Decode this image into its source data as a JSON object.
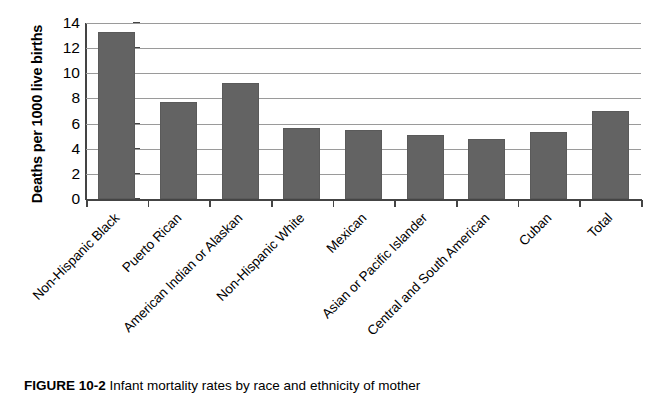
{
  "chart_data": {
    "type": "bar",
    "title": "",
    "xlabel": "",
    "ylabel": "Deaths per 1000 live births",
    "ylim": [
      0,
      14
    ],
    "ytick_labels": [
      "14",
      "12",
      "10",
      "8",
      "6",
      "4",
      "2",
      "0"
    ],
    "yticks": [
      14,
      12,
      10,
      8,
      6,
      4,
      2,
      0
    ],
    "grid": "horizontal",
    "legend": "none",
    "bar_color": "#636363",
    "categories": [
      "Non-Hispanic Black",
      "Puerto Rican",
      "American Indian or Alaskan",
      "Non-Hispanic White",
      "Mexican",
      "Asian or Pacific Islander",
      "Central and South American",
      "Cuban",
      "Total"
    ],
    "values": [
      13.3,
      7.7,
      9.2,
      5.65,
      5.5,
      5.1,
      4.8,
      5.35,
      7.0
    ]
  },
  "caption": {
    "figure_number": "FIGURE 10-2",
    "text": "Infant mortality rates by race and ethnicity of mother"
  }
}
